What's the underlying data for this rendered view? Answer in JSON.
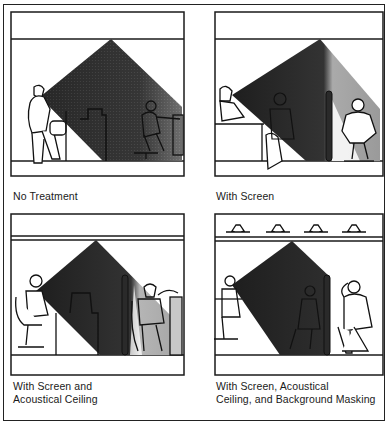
{
  "figure": {
    "panels": [
      {
        "id": "no-treatment",
        "caption_lines": [
          "No Treatment"
        ],
        "features": {
          "screen": false,
          "acoustical_ceiling": false,
          "background_masking": false,
          "light_fixtures": 0
        }
      },
      {
        "id": "with-screen",
        "caption_lines": [
          "With Screen"
        ],
        "features": {
          "screen": true,
          "acoustical_ceiling": false,
          "background_masking": false,
          "light_fixtures": 0
        }
      },
      {
        "id": "screen-and-ceiling",
        "caption_lines": [
          "With Screen and",
          "Acoustical Ceiling"
        ],
        "features": {
          "screen": true,
          "acoustical_ceiling": true,
          "background_masking": false,
          "light_fixtures": 0
        }
      },
      {
        "id": "screen-ceiling-masking",
        "caption_lines": [
          "With Screen, Acoustical",
          "Ceiling, and Background Masking"
        ],
        "features": {
          "screen": true,
          "acoustical_ceiling": true,
          "background_masking": true,
          "light_fixtures": 4
        }
      }
    ]
  },
  "colors": {
    "ink": "#1a1a1a",
    "sound_dark": "#2b2b2b",
    "sound_light": "#9a9a9a",
    "paper": "#ffffff"
  }
}
